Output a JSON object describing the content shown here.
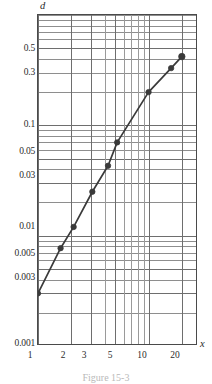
{
  "figure": {
    "caption": "Figure 15-3",
    "y_axis_name": "d",
    "x_axis_name": "x"
  },
  "chart_data": {
    "type": "line",
    "title": "",
    "subtitle": "",
    "xlabel": "x",
    "ylabel": "d",
    "xscale": "log",
    "yscale": "log",
    "xlim": [
      1,
      28
    ],
    "ylim": [
      0.001,
      1.0
    ],
    "grid": true,
    "legend": null,
    "xticks": [
      1,
      2,
      3,
      5,
      10,
      20
    ],
    "xtick_labels": [
      "1",
      "2",
      "3",
      "5",
      "10",
      "20"
    ],
    "yticks": [
      0.001,
      0.003,
      0.005,
      0.01,
      0.03,
      0.05,
      0.1,
      0.3,
      0.5
    ],
    "ytick_labels": [
      "0.001",
      "0.003",
      "0.005",
      "0.01",
      "0.03",
      "0.05",
      "0.1",
      "0.3",
      "0.5"
    ],
    "series": [
      {
        "name": "d",
        "marker": "filled-circle",
        "color": "#3a3a3a",
        "x": [
          1.0,
          1.6,
          2.1,
          3.1,
          4.3,
          5.2,
          10.0,
          16.0,
          20.0
        ],
        "y": [
          0.003,
          0.0077,
          0.012,
          0.025,
          0.043,
          0.07,
          0.2,
          0.33,
          0.42
        ]
      }
    ]
  },
  "ytick_positions": [
    {
      "label": "0.5",
      "top": 44
    },
    {
      "label": "0.3",
      "top": 68
    },
    {
      "label": "0.1",
      "top": 120
    },
    {
      "label": "0.05",
      "top": 147
    },
    {
      "label": "0.03",
      "top": 171
    },
    {
      "label": "0.01",
      "top": 222
    },
    {
      "label": "0.005",
      "top": 249
    },
    {
      "label": "0.003",
      "top": 273
    },
    {
      "label": "0.001",
      "top": 339
    }
  ],
  "xtick_positions": [
    {
      "label": "1",
      "left": 30
    },
    {
      "label": "2",
      "left": 63
    },
    {
      "label": "3",
      "left": 84
    },
    {
      "label": "5",
      "left": 110
    },
    {
      "label": "10",
      "left": 142
    },
    {
      "label": "20",
      "left": 175
    }
  ],
  "colors": {
    "grid_major": "#6e6e6e",
    "grid_minor": "#9a9a9a",
    "frame": "#4a4a4a",
    "curve": "#3a3a3a",
    "marker": "#3a3a3a",
    "background": "#ffffff",
    "text": "#2b2b2b",
    "caption": "#b9b9b9"
  }
}
